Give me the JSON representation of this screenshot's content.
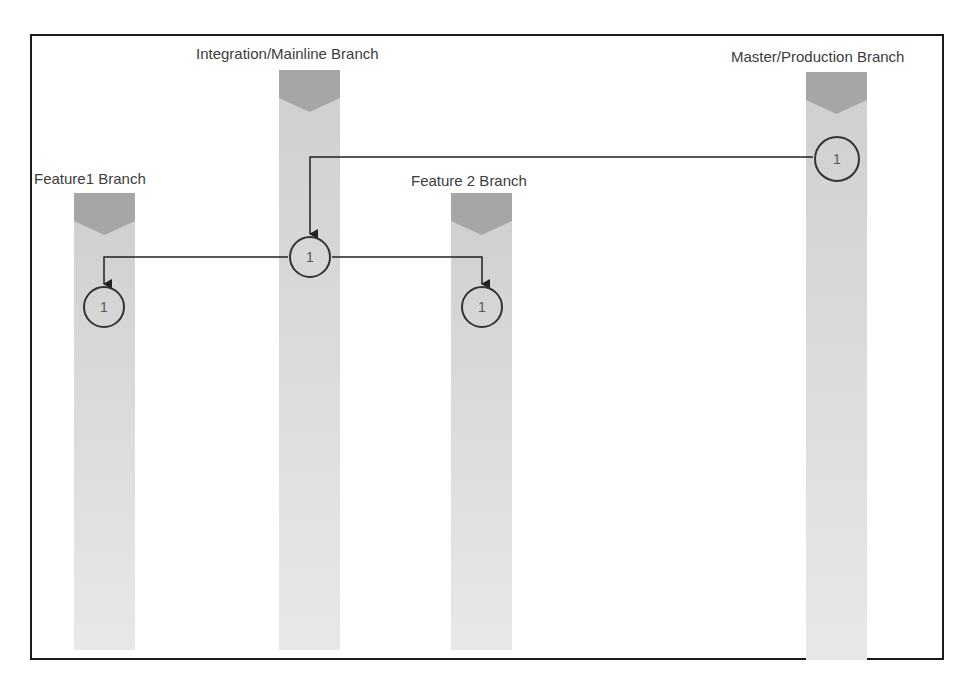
{
  "branches": [
    {
      "id": "feature1",
      "label": "Feature1 Branch",
      "node_label": "1"
    },
    {
      "id": "integration",
      "label": "Integration/Mainline Branch",
      "node_label": "1"
    },
    {
      "id": "feature2",
      "label": "Feature 2 Branch",
      "node_label": "1"
    },
    {
      "id": "master",
      "label": "Master/Production Branch",
      "node_label": "1"
    }
  ],
  "connections": [
    {
      "from": "master",
      "to": "integration"
    },
    {
      "from": "integration",
      "to": "feature1"
    },
    {
      "from": "integration",
      "to": "feature2"
    }
  ],
  "colors": {
    "lane": "#d9d9d9",
    "lane_head": "#a6a6a6",
    "line": "#222222",
    "frame": "#1a1a1a"
  }
}
